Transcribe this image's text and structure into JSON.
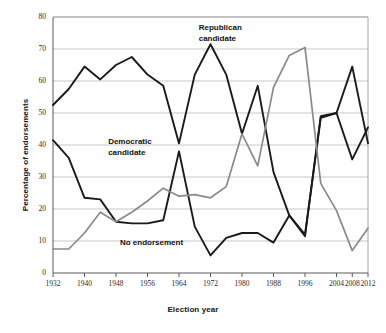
{
  "chart_data": {
    "type": "line",
    "title": "",
    "xlabel": "Election year",
    "ylabel": "Percentage of endorsements",
    "xlim": [
      1932,
      2012
    ],
    "ylim": [
      0,
      80
    ],
    "yticks": [
      0,
      10,
      20,
      30,
      40,
      50,
      60,
      70,
      80
    ],
    "xticks": [
      1932,
      1940,
      1948,
      1956,
      1964,
      1972,
      1980,
      1988,
      1996,
      2004,
      2008,
      2012
    ],
    "xticklabels": [
      "1932",
      "1940",
      "1948",
      "1956",
      "1964",
      "1972",
      "1980",
      "1988",
      "1996",
      "2004",
      "2008",
      "2012"
    ],
    "yticklabels": [
      "0",
      "10",
      "20",
      "30",
      "40",
      "50",
      "60",
      "70",
      "80"
    ],
    "grid": "horizontal",
    "legend": "inline-annotations",
    "x": [
      1932,
      1936,
      1940,
      1944,
      1948,
      1952,
      1956,
      1960,
      1964,
      1968,
      1972,
      1976,
      1980,
      1984,
      1988,
      1992,
      1996,
      2000,
      2004,
      2008,
      2012
    ],
    "series": [
      {
        "name": "Republican candidate",
        "color": "#1a1a1a",
        "values": [
          52.5,
          57.5,
          64.5,
          60.5,
          65.0,
          67.5,
          62.0,
          58.5,
          40.5,
          62.0,
          71.5,
          62.0,
          43.5,
          58.5,
          31.5,
          18.0,
          12.0,
          48.5,
          50.0,
          64.5,
          40.5
        ]
      },
      {
        "name": "Democratic candidate",
        "color": "#1a1a1a",
        "values": [
          41.5,
          36.0,
          23.5,
          23.0,
          16.0,
          15.5,
          15.5,
          16.5,
          38.0,
          14.5,
          5.5,
          11.0,
          12.5,
          12.5,
          9.5,
          18.0,
          11.5,
          49.0,
          50.0,
          35.5,
          45.5
        ]
      },
      {
        "name": "No endorsement",
        "color": "#8a8a8a",
        "values": [
          7.5,
          7.5,
          12.5,
          19.0,
          16.0,
          19.0,
          22.5,
          26.5,
          24.0,
          24.5,
          23.5,
          27.0,
          43.5,
          33.5,
          58.0,
          68.0,
          70.5,
          28.0,
          19.5,
          7.0,
          14.0
        ]
      }
    ],
    "annotations": [
      {
        "text": "Republican\ncandidate",
        "x_year": 1969,
        "y_value": 76.5,
        "style": "dark"
      },
      {
        "text": "Democratic\ncandidate",
        "x_year": 1946,
        "y_value": 41.0,
        "style": "dark"
      },
      {
        "text": "No endorsement",
        "x_year": 1949,
        "y_value": 9.5,
        "style": "dark"
      }
    ]
  }
}
